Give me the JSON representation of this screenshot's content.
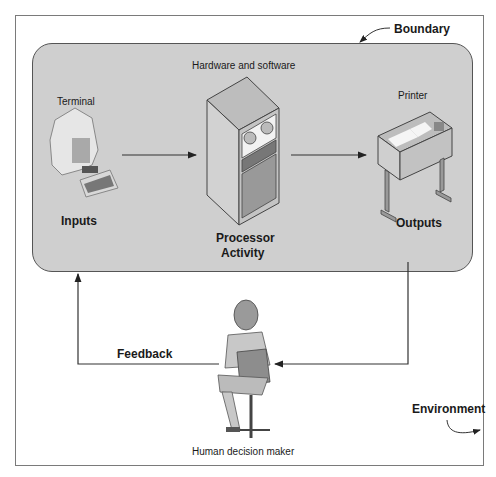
{
  "diagram": {
    "title_labels": {
      "boundary": "Boundary",
      "environment": "Environment"
    },
    "system": {
      "hardware_label": "Hardware and software",
      "input_device": "Terminal",
      "input_label": "Inputs",
      "processor_label_line1": "Processor",
      "processor_label_line2": "Activity",
      "output_device": "Printer",
      "output_label": "Outputs"
    },
    "feedback": {
      "label": "Feedback",
      "actor": "Human decision maker"
    },
    "colors": {
      "boundary_fill": "#cfcfcf",
      "line": "#333333",
      "background": "#ffffff"
    }
  }
}
